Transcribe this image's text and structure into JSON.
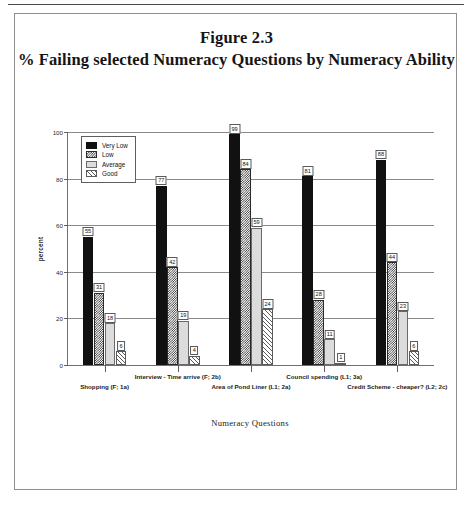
{
  "figure": {
    "title_line1": "Figure 2.3",
    "title_line2": "% Failing selected Numeracy Questions by Numeracy Ability"
  },
  "chart_data": {
    "type": "bar",
    "title": "% Failing selected Numeracy Questions by Numeracy Ability",
    "subtitle": "Figure 2.3",
    "xlabel": "Numeracy Questions",
    "ylabel": "percent",
    "ylim": [
      0,
      100
    ],
    "yticks": [
      0,
      20,
      40,
      60,
      80,
      100
    ],
    "grid": true,
    "legend_position": "top-left-inside",
    "categories": [
      "Shopping (F; 1a)",
      "Interview - Time arrive (F; 2b)",
      "Area of Pond Liner (L1; 2a)",
      "Council spending (L1; 3a)",
      "Credit Scheme - cheaper? (L2; 2c)"
    ],
    "series": [
      {
        "name": "Very Low",
        "pattern": "solid-black",
        "values": [
          55,
          77,
          99,
          81,
          88
        ]
      },
      {
        "name": "Low",
        "pattern": "dense-checker",
        "values": [
          31,
          42,
          84,
          28,
          44
        ]
      },
      {
        "name": "Average",
        "pattern": "light-grey",
        "values": [
          18,
          19,
          59,
          11,
          23
        ]
      },
      {
        "name": "Good",
        "pattern": "diagonal-hatch",
        "values": [
          6,
          4,
          24,
          1,
          6
        ]
      }
    ]
  }
}
